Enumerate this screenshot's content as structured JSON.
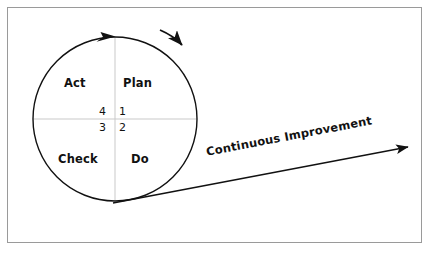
{
  "diagram": {
    "background_color": "#ffffff",
    "frame_border_color": "#9a9a9a",
    "stroke_color": "#111111",
    "guide_color": "#c9c9c9",
    "cycle": {
      "name": "PDCA circle",
      "center_x": 115,
      "center_y": 119,
      "radius": 82,
      "quadrants": [
        {
          "label": "Plan",
          "number": "1",
          "position": "top-right"
        },
        {
          "label": "Do",
          "number": "2",
          "position": "bottom-right"
        },
        {
          "label": "Check",
          "number": "3",
          "position": "bottom-left"
        },
        {
          "label": "Act",
          "number": "4",
          "position": "top-left"
        }
      ]
    },
    "arrows": {
      "cycle_arrow_name": "clockwise-cycle-arrow",
      "direction_arrow_name": "rotation-direction-arrow",
      "improvement_arrow_name": "continuous-improvement-arrow"
    },
    "improvement": {
      "label": "Continuous Improvement",
      "angle_deg": -10.8
    }
  }
}
